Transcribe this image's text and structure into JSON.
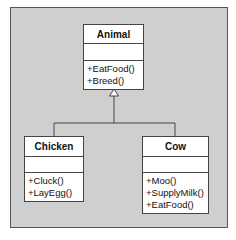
{
  "diagram": {
    "type": "UML class diagram",
    "colors": {
      "frame_bg": "#cfcfcf",
      "box_bg": "#ffffff",
      "line": "#444444"
    },
    "classes": [
      {
        "name": "Animal",
        "attributes": [],
        "methods": [
          "+EatFood()",
          "+Breed()"
        ]
      },
      {
        "name": "Chicken",
        "attributes": [],
        "methods": [
          "+Cluck()",
          "+LayEgg()"
        ]
      },
      {
        "name": "Cow",
        "attributes": [],
        "methods": [
          "+Moo()",
          "+SupplyMilk()",
          "+EatFood()"
        ]
      }
    ],
    "relationships": [
      {
        "type": "generalization",
        "from": "Chicken",
        "to": "Animal"
      },
      {
        "type": "generalization",
        "from": "Cow",
        "to": "Animal"
      }
    ]
  }
}
